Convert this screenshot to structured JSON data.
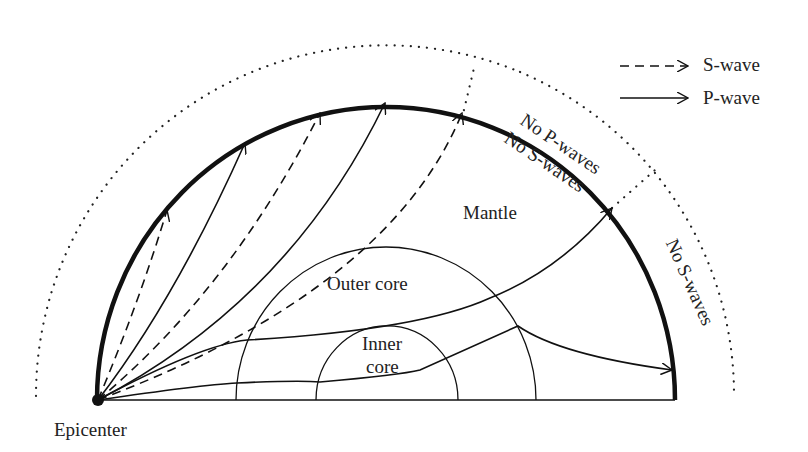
{
  "diagram": {
    "colors": {
      "ink": "#111111",
      "text": "#222222",
      "background": "#ffffff"
    },
    "legend": [
      {
        "style": "dashed",
        "label": "S-wave"
      },
      {
        "style": "solid",
        "label": "P-wave"
      }
    ],
    "layers": {
      "mantle": "Mantle",
      "outer_core": "Outer core",
      "inner_core_line1": "Inner",
      "inner_core_line2": "core"
    },
    "zones": {
      "p_shadow": "No P-waves",
      "s_shadow_upper": "No S-waves",
      "s_shadow_right": "No S-waves"
    },
    "source_label": "Epicenter"
  }
}
